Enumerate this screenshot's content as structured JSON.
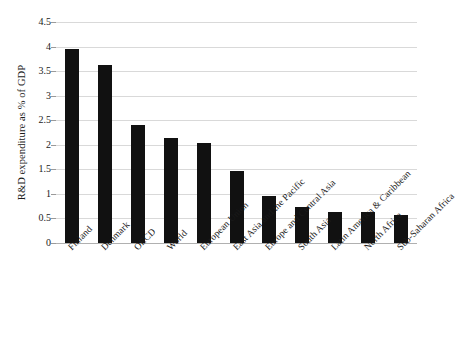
{
  "chart_data": {
    "type": "bar",
    "title": "",
    "xlabel": "",
    "ylabel": "R&D expenditure as % of GDP",
    "ylim": [
      0,
      4.5
    ],
    "ytick_labels": [
      "0",
      "0.5",
      "1",
      "1.5",
      "2",
      "2.5",
      "3",
      "3.5",
      "4",
      "4.5"
    ],
    "ytick_values": [
      0,
      0.5,
      1,
      1.5,
      2,
      2.5,
      3,
      3.5,
      4,
      4.5
    ],
    "grid": true,
    "legend": "none",
    "bar_color": "#111111",
    "gridline_color": "#d9d9d9",
    "categories": [
      "Finland",
      "Denmark",
      "OECD",
      "World",
      "European Union",
      "East Asia and the Pacific",
      "Europe and Central Asia",
      "South Asia",
      "Latin America & Caribbean",
      "North Africa",
      "Sub-Saharan Africa"
    ],
    "values": [
      3.95,
      3.62,
      2.41,
      2.14,
      2.04,
      1.47,
      0.95,
      0.74,
      0.64,
      0.63,
      0.57
    ]
  }
}
